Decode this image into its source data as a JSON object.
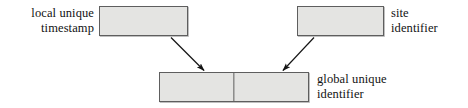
{
  "diagram": {
    "type": "block-diagram",
    "canvas": {
      "width": 468,
      "height": 108,
      "background": "#ffffff"
    },
    "style": {
      "box_fill": "#e4e4e2",
      "box_border": "#5e5e5e",
      "text_color": "#121212",
      "edge_color": "#1a1a1a"
    },
    "nodes": [
      {
        "id": "local-unique-timestamp",
        "label": "local unique\ntimestamp",
        "label_position": "left",
        "segments": 1
      },
      {
        "id": "site-identifier",
        "label": "site\nidentifier",
        "label_position": "right",
        "segments": 1
      },
      {
        "id": "global-unique-identifier",
        "label": "global unique\nidentifier",
        "label_position": "right",
        "segments": 2
      }
    ],
    "edges": [
      {
        "id": "edge-timestamp-to-guid",
        "from": "local-unique-timestamp",
        "to": "global-unique-identifier",
        "arrow": "end"
      },
      {
        "id": "edge-site-to-guid",
        "from": "site-identifier",
        "to": "global-unique-identifier",
        "arrow": "end"
      }
    ]
  }
}
